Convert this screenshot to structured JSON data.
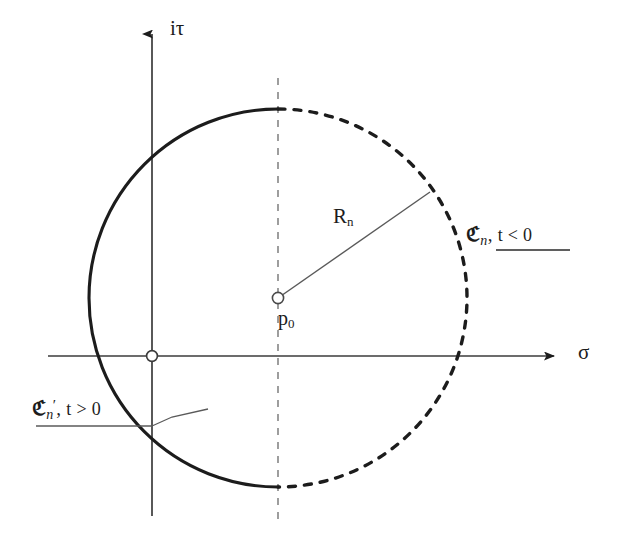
{
  "figure": {
    "type": "diagram",
    "background_color": "#ffffff",
    "stroke_color": "#1c1c1c"
  },
  "axes": {
    "vertical": {
      "label": "iτ",
      "label_parts": {
        "imaginary_unit": "i",
        "variable": "τ"
      },
      "x": 152,
      "y_top": 28,
      "y_bottom": 516,
      "arrow": "up"
    },
    "horizontal": {
      "label": "σ",
      "y": 356,
      "x_left": 48,
      "x_right": 560,
      "arrow": "right"
    },
    "origin": {
      "x": 152,
      "y": 356,
      "marker": "open-circle"
    }
  },
  "guide_line": {
    "name": "vertical-dashed-guide",
    "x": 278,
    "y_top": 78,
    "y_bottom": 520,
    "style": "dashed"
  },
  "circle": {
    "center": {
      "x": 278,
      "y": 298
    },
    "radius": 189,
    "left_arc_style": "solid",
    "right_arc_style": "dashed"
  },
  "center_point": {
    "label": "p",
    "subscript": "0",
    "marker": "open-circle",
    "x": 278,
    "y": 298
  },
  "radius_line": {
    "label": "R",
    "subscript": "n",
    "from": {
      "x": 278,
      "y": 298
    },
    "to": {
      "x": 430,
      "y": 192
    }
  },
  "contour_labels": {
    "dashed_arc": {
      "symbol": "ℭ",
      "subscript": "n",
      "prime": "",
      "separator": ",",
      "condition": "t < 0",
      "underline": true,
      "x": 466,
      "y": 224
    },
    "solid_arc": {
      "symbol": "ℭ",
      "subscript": "n",
      "prime": "′",
      "separator": ",",
      "condition": "t > 0",
      "underline": true,
      "x": 32,
      "y": 398,
      "leader_line": {
        "from": {
          "x": 152,
          "y": 430
        },
        "bend": {
          "x": 172,
          "y": 421
        },
        "to": {
          "x": 206,
          "y": 412
        }
      }
    }
  }
}
